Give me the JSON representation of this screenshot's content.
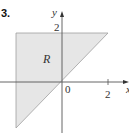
{
  "problem": {
    "number": "3."
  },
  "diagram": {
    "axes": {
      "x_label": "x",
      "y_label": "y",
      "origin_label": "0",
      "x_tick_label": "2",
      "y_tick_label": "2"
    },
    "region": {
      "label": "R",
      "fill_color": "#e6e6e6",
      "edge_color": "#9a9a9a",
      "vertices": [
        [
          -2,
          2
        ],
        [
          2,
          2
        ],
        [
          -2,
          -2
        ]
      ],
      "description": "Triangle bounded by x = -2, y = 2, and y = x"
    },
    "axis_color": "#555555"
  }
}
